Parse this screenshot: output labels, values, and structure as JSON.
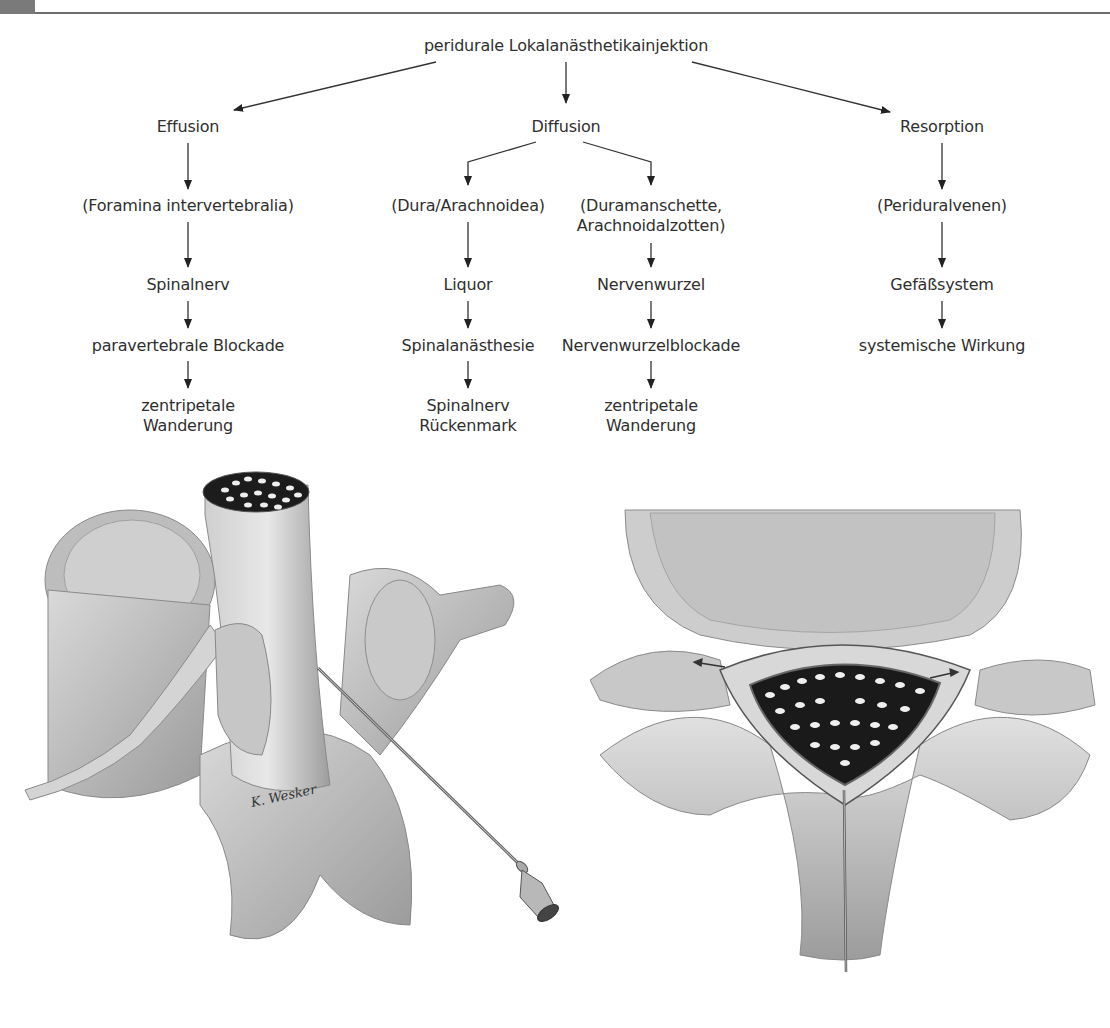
{
  "header": {
    "accent_block_color": "#7a7a7a",
    "rule_color": "#6e6e6e"
  },
  "flowchart": {
    "root": "peridurale Lokalanästhetikainjektion",
    "branches": [
      {
        "label": "Effusion",
        "steps": [
          "(Foramina intervertebralia)",
          "Spinalnerv",
          "paravertebrale Blockade",
          "zentripetale Wanderung"
        ]
      },
      {
        "label": "Diffusion",
        "sub_branches": [
          {
            "steps": [
              "(Dura/Arachnoidea)",
              "Liquor",
              "Spinalanästhesie",
              "Spinalnerv Rückenmark"
            ]
          },
          {
            "steps": [
              "(Duramanschette, Arachnoidalzotten)",
              "Nervenwurzel",
              "Nervenwurzelblockade",
              "zentripetale Wanderung"
            ]
          }
        ]
      },
      {
        "label": "Resorption",
        "steps": [
          "(Periduralvenen)",
          "Gefäßsystem",
          "systemische Wirkung"
        ]
      }
    ],
    "labels": {
      "root": "peridurale Lokalanästhetikainjektion",
      "effusion": "Effusion",
      "diffusion": "Diffusion",
      "resorption": "Resorption",
      "foramina": "(Foramina intervertebralia)",
      "spinalnerv_1": "Spinalnerv",
      "paravertebral": "paravertebrale Blockade",
      "zentripetal_1a": "zentripetale",
      "zentripetal_1b": "Wanderung",
      "dura": "(Dura/Arachnoidea)",
      "liquor": "Liquor",
      "spinalanaesthesie": "Spinalanästhesie",
      "spinalnerv_2a": "Spinalnerv",
      "spinalnerv_2b": "Rückenmark",
      "duramanschette_a": "(Duramanschette,",
      "duramanschette_b": "Arachnoidalzotten)",
      "nervenwurzel": "Nervenwurzel",
      "nervenwurzelblockade": "Nervenwurzelblockade",
      "zentripetal_2a": "zentripetale",
      "zentripetal_2b": "Wanderung",
      "periduralvenen": "(Periduralvenen)",
      "gefaesssystem": "Gefäßsystem",
      "systemisch": "systemische Wirkung"
    }
  },
  "illustrations": {
    "left": {
      "description": "Lumbar vertebra with dural sac cross-section, spinal nerve root and epidural needle (lateral oblique view)",
      "signature": "K. Wesker"
    },
    "right": {
      "description": "Axial cross-section of vertebral canal showing dural sac, epidural space and midline needle, arrows indicating spread along nerve roots"
    }
  }
}
